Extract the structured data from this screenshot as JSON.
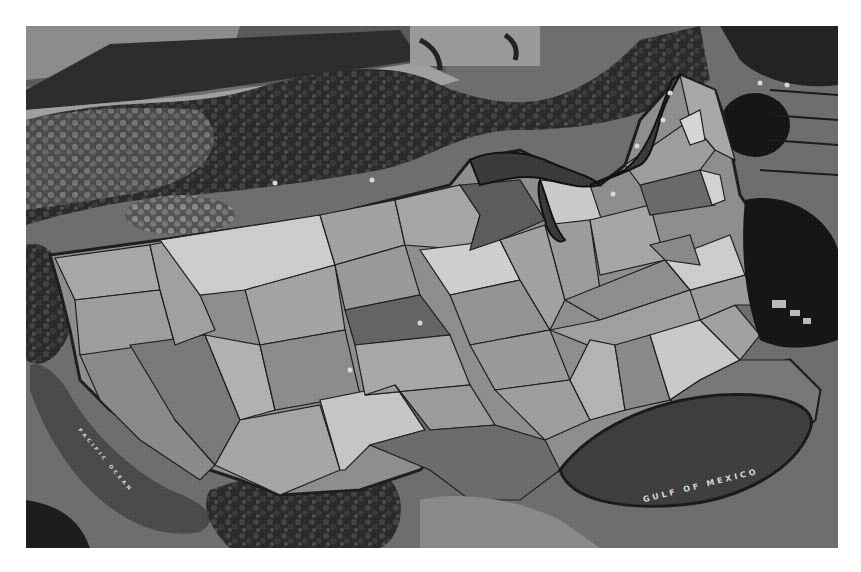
{
  "image": {
    "description": "Grayscale aerial photograph of a large outdoor floor map of the contiguous United States surrounded by landscaping",
    "palette": {
      "background": "#ffffff",
      "ground": "#6e6e6e",
      "ground_light": "#8a8a8a",
      "water": "#3c3c3c",
      "foliage": "#2a2a2a",
      "state_light": "#c8c8c8",
      "state_mid": "#9c9c9c",
      "state_dark": "#6a6a6a",
      "border": "#1e1e1e",
      "label": "#d8d8d8"
    }
  },
  "labels": {
    "gulf": "GULF  OF  MEXICO",
    "pacific": "PACIFIC OCEAN"
  },
  "map": {
    "region": "Contiguous United States",
    "bodies_of_water": [
      "Gulf of Mexico",
      "Pacific Ocean",
      "Great Lakes",
      "Atlantic Ocean"
    ]
  }
}
